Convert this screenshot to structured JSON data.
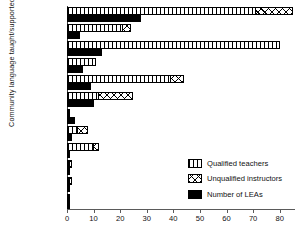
{
  "chart_data": {
    "type": "bar",
    "orientation": "horizontal",
    "title": "",
    "xlabel": "",
    "ylabel": "Community language taught/supported",
    "xlim": [
      0,
      85
    ],
    "xticks": [
      0,
      10,
      20,
      30,
      40,
      50,
      60,
      70,
      80
    ],
    "grid": false,
    "legend_position": "center-right",
    "categories": [
      "Urdu",
      "Urdu/Panjabi",
      "Panjabi",
      "Hindi",
      "Bengali",
      "Gujerati",
      "Italian",
      "Chinese",
      "Turkish",
      "Greek",
      "Arabic",
      "Creoles"
    ],
    "series": [
      {
        "name": "Qualified teachers",
        "pattern": "vertical-bars",
        "values": [
          71,
          21,
          80,
          11,
          39,
          12,
          1,
          4,
          10,
          1,
          1,
          1
        ]
      },
      {
        "name": "Unqualified instructors",
        "pattern": "cross-hatch",
        "values": [
          85,
          24,
          80,
          0,
          44,
          25,
          0,
          8,
          12,
          2,
          2,
          0
        ]
      },
      {
        "name": "Number of LEAs",
        "pattern": "solid-black",
        "values": [
          28,
          5,
          13,
          6,
          9,
          10,
          3,
          2,
          1,
          1,
          1,
          1
        ]
      }
    ]
  },
  "legend": {
    "items": [
      {
        "label": "Qualified teachers",
        "pattern": "vertical-bars"
      },
      {
        "label": "Unqualified instructors",
        "pattern": "cross-hatch"
      },
      {
        "label": "Number of LEAs",
        "pattern": "solid-black"
      }
    ]
  }
}
